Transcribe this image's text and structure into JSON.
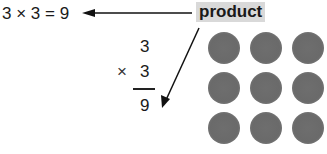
{
  "equation": {
    "horizontal": "3 × 3 = 9"
  },
  "label": {
    "text": "product",
    "highlight_color": "#d9d9d9"
  },
  "vertical": {
    "factor1": "3",
    "operator": "×",
    "factor2": "3",
    "result": "9"
  },
  "array": {
    "rows": 3,
    "cols": 3,
    "dot_color": "#6b6b6b"
  }
}
